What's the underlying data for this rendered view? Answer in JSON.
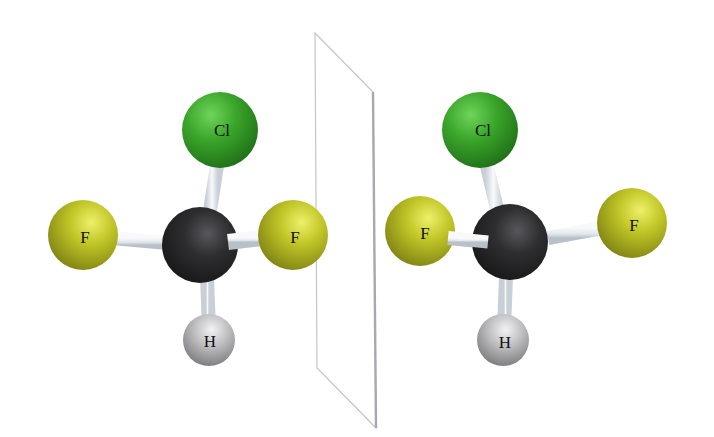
{
  "diagram": {
    "type": "molecular-ball-and-stick",
    "colors": {
      "background": "#ffffff",
      "chlorine": "#3aa52a",
      "fluorine": "#b8c020",
      "carbon": "#2e2e30",
      "hydrogen": "#b8b8ba",
      "bond": "#e4e8ec",
      "mirror": "#b8b8c0"
    },
    "molecules": [
      {
        "name": "left-molecule",
        "atoms": {
          "cl": {
            "label": "Cl",
            "x": 220,
            "y": 130,
            "r": 38
          },
          "f_left": {
            "label": "F",
            "x": 83,
            "y": 235,
            "r": 35
          },
          "c": {
            "label": "",
            "x": 200,
            "y": 245,
            "r": 38
          },
          "f_right": {
            "label": "F",
            "x": 293,
            "y": 235,
            "r": 35
          },
          "h": {
            "label": "H",
            "x": 209,
            "y": 340,
            "r": 26
          }
        }
      },
      {
        "name": "right-molecule",
        "atoms": {
          "cl": {
            "label": "Cl",
            "x": 480,
            "y": 130,
            "r": 38
          },
          "f_left": {
            "label": "F",
            "x": 420,
            "y": 231,
            "r": 35
          },
          "c": {
            "label": "",
            "x": 510,
            "y": 242,
            "r": 38
          },
          "f_right": {
            "label": "F",
            "x": 632,
            "y": 223,
            "r": 35
          },
          "h": {
            "label": "H",
            "x": 503,
            "y": 340,
            "r": 26
          }
        }
      }
    ],
    "mirror_plane": {
      "points": "315,33 373,92 376,428 317,368"
    }
  }
}
